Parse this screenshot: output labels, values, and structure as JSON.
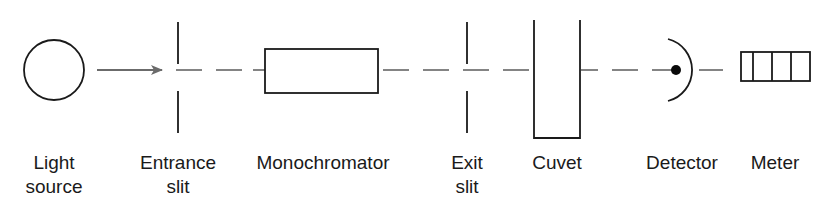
{
  "diagram": {
    "colors": {
      "line": "#1a1a1a",
      "beam": "#666666",
      "arrow": "#6b6b6b",
      "background": "#ffffff"
    },
    "components": [
      {
        "id": "light-source",
        "line1": "Light",
        "line2": "source"
      },
      {
        "id": "entrance-slit",
        "line1": "Entrance",
        "line2": "slit"
      },
      {
        "id": "monochromator",
        "line1": "Monochromator",
        "line2": ""
      },
      {
        "id": "exit-slit",
        "line1": "Exit",
        "line2": "slit"
      },
      {
        "id": "cuvet",
        "line1": "Cuvet",
        "line2": ""
      },
      {
        "id": "detector",
        "line1": "Detector",
        "line2": ""
      },
      {
        "id": "meter",
        "line1": "Meter",
        "line2": ""
      }
    ]
  }
}
